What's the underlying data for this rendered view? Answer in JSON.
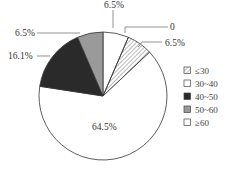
{
  "chart_data": {
    "type": "pie",
    "title": "",
    "start_angle_deg": 0,
    "direction": "clockwise",
    "slices": [
      {
        "category": "30~40",
        "value": 6.5,
        "label": "6.5%",
        "fill": "#ffffff",
        "pattern": "none"
      },
      {
        "category": "zero",
        "value": 0,
        "label": "0",
        "fill": "#ffffff",
        "pattern": "none"
      },
      {
        "category": "≤30",
        "value": 6.5,
        "label": "6.5%",
        "fill": "#ffffff",
        "pattern": "hatch"
      },
      {
        "category": "≥60",
        "value": 64.5,
        "label": "64.5%",
        "fill": "#ffffff",
        "pattern": "none"
      },
      {
        "category": "40~50",
        "value": 16.1,
        "label": "16.1%",
        "fill": "#2a2a2a",
        "pattern": "none"
      },
      {
        "category": "50~60",
        "value": 6.5,
        "label": "6.5%",
        "fill": "#9a9a9a",
        "pattern": "none"
      }
    ],
    "legend": {
      "position": "right",
      "entries": [
        {
          "label": "≤30",
          "fill": "#ffffff",
          "pattern": "hatch"
        },
        {
          "label": "30~40",
          "fill": "#ffffff",
          "pattern": "none"
        },
        {
          "label": "40~50",
          "fill": "#2a2a2a",
          "pattern": "none"
        },
        {
          "label": "50~60",
          "fill": "#9a9a9a",
          "pattern": "none"
        },
        {
          "label": "≥60",
          "fill": "#ffffff",
          "pattern": "none"
        }
      ]
    }
  },
  "labels": {
    "top": "6.5%",
    "zero": "0",
    "right": "6.5%",
    "left_top": "6.5%",
    "left": "16.1%",
    "center": "64.5%"
  },
  "legend": [
    "≤30",
    "30~40",
    "40~50",
    "50~60",
    "≥60"
  ]
}
